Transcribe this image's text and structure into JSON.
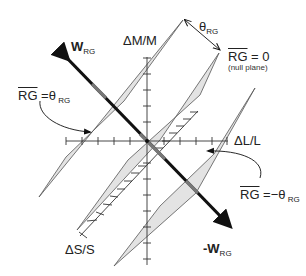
{
  "diagram": {
    "axes": {
      "dM": {
        "label": "ΔM/M"
      },
      "dL": {
        "label": "ΔL/L"
      },
      "dS": {
        "label": "ΔS/S"
      }
    },
    "vector_pos": {
      "main": "W",
      "sub": "RG"
    },
    "vector_neg": {
      "main": "-W",
      "sub": "RG"
    },
    "angle": {
      "symbol": "θ",
      "sub": "RG"
    },
    "planes": [
      {
        "id": "positive",
        "bar": "RG",
        "eq": " =θ",
        "sub": " RG"
      },
      {
        "id": "null",
        "bar": "RG",
        "eq": " = 0",
        "note": "(null plane)"
      },
      {
        "id": "negative",
        "bar": "RG",
        "eq": " =−θ",
        "sub": " RG"
      }
    ],
    "colors": {
      "plane_fill": "#e3e3e3",
      "plane_edge": "#555555",
      "vector": "#111111",
      "vector_inside": "#777777"
    }
  }
}
